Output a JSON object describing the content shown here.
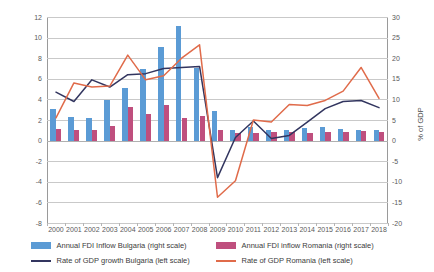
{
  "chart_data": {
    "type": "bar",
    "title": "",
    "xlabel": "",
    "ylabel": "Annual % change",
    "y2label": "% of GDP",
    "ylim": [
      -8,
      12
    ],
    "y2lim": [
      -20,
      30
    ],
    "ytick_step": 2,
    "y2tick_step": 5,
    "grid": true,
    "legend_position": "bottom",
    "categories": [
      "2000",
      "2001",
      "2002",
      "2003",
      "2004",
      "2005",
      "2006",
      "2007",
      "2008",
      "2009",
      "2010",
      "2011",
      "2012",
      "2013",
      "2014",
      "2015",
      "2016",
      "2017",
      "2018"
    ],
    "yticks_left": [
      "12",
      "10",
      "8",
      "6",
      "4",
      "2",
      "0",
      "-2",
      "-4",
      "-6",
      "-8"
    ],
    "yticks_right": [
      "30",
      "25",
      "20",
      "15",
      "10",
      "5",
      "0",
      "-5",
      "-10",
      "-15",
      "-20"
    ],
    "series": [
      {
        "name": "Annual FDI Inflow Bulgaria (right scale)",
        "type": "bar",
        "axis": "right",
        "units": "% of GDP",
        "color": "#5b9bd5",
        "values": [
          7.7,
          5.7,
          5.6,
          9.8,
          12.8,
          17.3,
          22.8,
          27.8,
          17.6,
          7.1,
          2.5,
          3.2,
          2.6,
          2.7,
          3.0,
          3.3,
          2.9,
          2.7,
          2.5
        ]
      },
      {
        "name": "Annual FDI inflow Romania (right scale)",
        "type": "bar",
        "axis": "right",
        "units": "% of GDP",
        "color": "#bf4f7e",
        "values": [
          2.8,
          2.7,
          2.5,
          3.6,
          8.2,
          6.5,
          8.7,
          5.6,
          6.0,
          2.5,
          1.8,
          1.9,
          2.0,
          2.0,
          1.8,
          2.1,
          2.2,
          2.3,
          2.1
        ]
      },
      {
        "name": "Rate of GDP growth Bulgaria (left scale)",
        "type": "line",
        "axis": "left",
        "units": "Annual % change",
        "color": "#32355f",
        "values": [
          4.7,
          3.8,
          5.9,
          5.2,
          6.4,
          6.5,
          7.0,
          7.1,
          7.2,
          -3.6,
          0.3,
          1.9,
          0.2,
          0.5,
          1.8,
          3.1,
          3.8,
          3.9,
          3.2
        ]
      },
      {
        "name": "Rate of GDP Romania (left scale)",
        "type": "line",
        "axis": "left",
        "units": "Annual % change",
        "color": "#e06b4a",
        "values": [
          2.2,
          5.6,
          5.2,
          5.3,
          8.3,
          5.9,
          6.3,
          8.0,
          9.3,
          -5.5,
          -3.9,
          2.0,
          1.8,
          3.5,
          3.4,
          3.9,
          4.8,
          7.1,
          4.1
        ]
      }
    ],
    "legend": [
      {
        "label": "Annual FDI Inflow Bulgaria (right scale)",
        "marker": "bar",
        "color": "#5b9bd5"
      },
      {
        "label": "Annual FDI inflow Romania (right scale)",
        "marker": "bar",
        "color": "#bf4f7e"
      },
      {
        "label": "Rate of GDP growth Bulgaria (left scale)",
        "marker": "line",
        "color": "#32355f"
      },
      {
        "label": "Rate of GDP Romania (left scale)",
        "marker": "line",
        "color": "#e06b4a"
      }
    ]
  }
}
